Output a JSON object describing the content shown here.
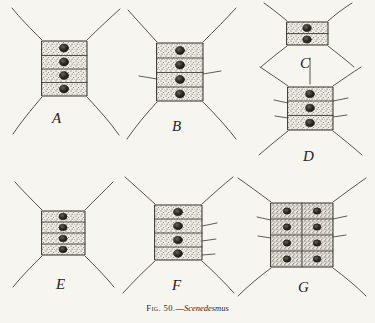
{
  "plate": {
    "background_color": "#f7f5f0",
    "ink_color": "#3a3632",
    "caption": {
      "figure_prefix": "Fig. 50.",
      "dash": "—",
      "taxon": "Scenedesmus",
      "full_text": "Fig. 50.—Scenedesmus"
    },
    "subject": "Scenedesmus coenobia",
    "illustration_type": "line-drawing-stipple",
    "panel_count": 7
  },
  "panels": [
    {
      "id": "A",
      "label": "A",
      "label_x": 52,
      "label_y": 118,
      "center_x": 64,
      "center_y": 68,
      "cell_count": 4,
      "cell_columns": 1,
      "cell_rows": 4,
      "body_width": 46,
      "body_height": 60,
      "corner_spines": 4,
      "lateral_spines": 0,
      "apical_spine": false,
      "description": "Four-celled linear coenobium with four long curved polar spines"
    },
    {
      "id": "B",
      "label": "B",
      "label_x": 172,
      "label_y": 126,
      "center_x": 180,
      "center_y": 72,
      "cell_count": 4,
      "cell_columns": 1,
      "cell_rows": 4,
      "body_width": 48,
      "body_height": 64,
      "corner_spines": 4,
      "lateral_spines": 2,
      "apical_spine": false,
      "description": "Four-celled coenobium with polar spines plus short lateral spines on inner cells"
    },
    {
      "id": "C",
      "label": "C",
      "label_x": 300,
      "label_y": 60,
      "center_x": 307,
      "center_y": 33,
      "cell_count": 2,
      "cell_columns": 1,
      "cell_rows": 2,
      "body_width": 42,
      "body_height": 26,
      "corner_spines": 4,
      "lateral_spines": 0,
      "apical_spine": false,
      "description": "Small two-celled coenobium with four divergent polar spines"
    },
    {
      "id": "D",
      "label": "D",
      "label_x": 303,
      "label_y": 152,
      "center_x": 310,
      "center_y": 108,
      "cell_count": 3,
      "cell_columns": 1,
      "cell_rows": 3,
      "body_width": 46,
      "body_height": 48,
      "corner_spines": 4,
      "lateral_spines": 4,
      "apical_spine": true,
      "description": "Three-celled coenobium bearing a median apical spine and lateral spines"
    },
    {
      "id": "E",
      "label": "E",
      "label_x": 56,
      "label_y": 283,
      "center_x": 63,
      "center_y": 233,
      "cell_count": 4,
      "cell_columns": 1,
      "cell_rows": 4,
      "body_width": 42,
      "body_height": 46,
      "corner_spines": 4,
      "lateral_spines": 0,
      "apical_spine": false,
      "description": "Compact four-celled coenobium with four polar spines"
    },
    {
      "id": "F",
      "label": "F",
      "label_x": 172,
      "label_y": 285,
      "center_x": 178,
      "center_y": 232,
      "cell_count": 4,
      "cell_columns": 1,
      "cell_rows": 4,
      "body_width": 48,
      "body_height": 58,
      "corner_spines": 4,
      "lateral_spines": 3,
      "apical_spine": false,
      "description": "Four-celled coenobium with polar spines and short lateral spines"
    },
    {
      "id": "G",
      "label": "G",
      "label_x": 298,
      "label_y": 288,
      "center_x": 302,
      "center_y": 235,
      "cell_count": 8,
      "cell_columns": 2,
      "cell_rows": 4,
      "body_width": 62,
      "body_height": 66,
      "corner_spines": 4,
      "lateral_spines": 4,
      "apical_spine": false,
      "description": "Large eight-celled alternating (biseriate) coenobium with polar and lateral spines"
    }
  ]
}
